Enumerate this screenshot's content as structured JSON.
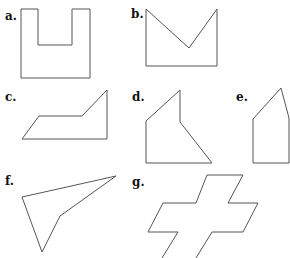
{
  "labels": {
    "a": "a.",
    "b": "b.",
    "c": "c.",
    "d": "d.",
    "e": "e.",
    "f": "f.",
    "g": "g."
  },
  "shapes": {
    "a": "21,9 38,9 38,45 72,45 72,9 90,9 90,78 21,78",
    "b": "146,9 189,48 217,9 217,66 146,66",
    "c": "22,139 39,116 82,116 107,90 107,139",
    "d": "180,90 146,121 146,163 212,163 180,122",
    "e": "281,88 253,119 253,163 289,163 289,118",
    "f": "22,197 116,176 60,216 42,252",
    "g": "162,258 178,232 148,232 163,203 196,203 207,175 243,175 228,203 258,203 243,232 212,232 196,258"
  },
  "stroke_color": "#555555"
}
